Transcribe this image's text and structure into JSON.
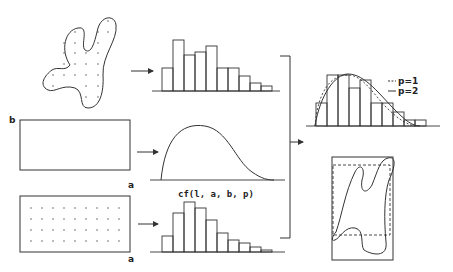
{
  "diagram": {
    "labels": {
      "rect_b": "b",
      "rect_a_top": "a",
      "rect_a_bottom": "a",
      "curve_caption": "cf(l, a, b, p)",
      "legend_p1": "p=1",
      "legend_p2": "p=2"
    },
    "histograms": {
      "top": [
        17,
        30,
        22,
        24,
        26,
        14,
        14,
        9,
        5,
        3
      ],
      "bottom": [
        12,
        24,
        30,
        27,
        21,
        14,
        10,
        7,
        4,
        2
      ],
      "result": [
        18,
        33,
        38,
        26,
        32,
        18,
        13,
        7,
        4
      ]
    },
    "colors": {
      "stroke": "#333333",
      "background": "#ffffff"
    }
  }
}
